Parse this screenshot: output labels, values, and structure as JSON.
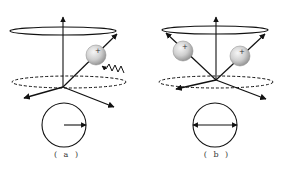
{
  "figure": {
    "colors": {
      "line": "#111111",
      "sphere_light": "#f4f4f4",
      "sphere_dark": "#9a9a9a",
      "background": "#ffffff"
    },
    "panels": [
      {
        "id": "a",
        "label": "( a )",
        "label_pos": [
          67,
          150
        ],
        "axis": {
          "x": 63,
          "top": 17,
          "origin_y": 87
        },
        "top_ellipse": {
          "cx": 63,
          "cy": 31,
          "rx": 53,
          "ry": 4
        },
        "dashed_ellipse": {
          "cx": 69,
          "cy": 82,
          "rx": 57,
          "ry": 6
        },
        "lower_arrows": [
          {
            "x2": 24,
            "y2": 98
          },
          {
            "x2": 114,
            "y2": 107
          }
        ],
        "spin_vectors": [
          {
            "x2": 117,
            "y2": 34
          }
        ],
        "spheres": [
          {
            "cx": 96,
            "cy": 55,
            "r": 10,
            "sign": "+"
          }
        ],
        "photon": {
          "description": "wavy incoming photon",
          "start": [
            124,
            73
          ],
          "end": [
            96,
            66
          ]
        },
        "bottom_circle": {
          "cx": 64,
          "cy": 125,
          "r": 22,
          "arrow": "single-right"
        }
      },
      {
        "id": "b",
        "label": "( b )",
        "label_pos": [
          217,
          150
        ],
        "axis": {
          "x": 216,
          "top": 17,
          "origin_y": 80
        },
        "top_ellipse": {
          "cx": 215,
          "cy": 30,
          "rx": 53,
          "ry": 4
        },
        "dashed_ellipse": {
          "cx": 216,
          "cy": 82,
          "rx": 57,
          "ry": 6
        },
        "lower_arrows": [
          {
            "x2": 176,
            "y2": 89
          },
          {
            "x2": 266,
            "y2": 99
          }
        ],
        "spin_vectors": [
          {
            "x2": 166,
            "y2": 33
          },
          {
            "x2": 265,
            "y2": 34
          }
        ],
        "spheres": [
          {
            "cx": 183,
            "cy": 51,
            "r": 10,
            "sign": "+"
          },
          {
            "cx": 240,
            "cy": 56,
            "r": 10,
            "sign": "+"
          }
        ],
        "bottom_circle": {
          "cx": 215,
          "cy": 125,
          "r": 22,
          "arrow": "double"
        }
      }
    ]
  }
}
